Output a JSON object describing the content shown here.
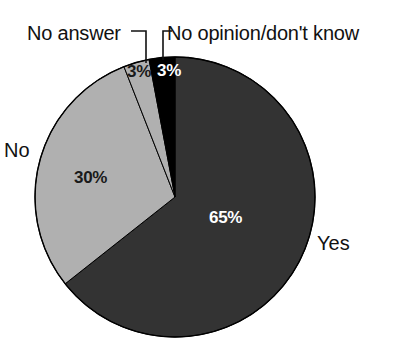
{
  "chart_data": {
    "type": "pie",
    "title": "",
    "subtitle": "",
    "xlabel": "",
    "ylabel": "",
    "legend_position": "none",
    "grid": false,
    "start_angle_deg": 0,
    "direction": "clockwise",
    "categories": [
      "Yes",
      "No",
      "No answer",
      "No opinion/don't know"
    ],
    "values": [
      65,
      30,
      3,
      3
    ],
    "value_labels": [
      "65%",
      "30%",
      "3%",
      "3%"
    ],
    "colors": [
      "#333333",
      "#b0b0b0",
      "#b0b0b0",
      "#000000"
    ],
    "slices": [
      {
        "label": "Yes",
        "value": 65,
        "value_label": "65%",
        "color": "#333333",
        "value_label_color": "#ffffff",
        "callout": false
      },
      {
        "label": "No",
        "value": 30,
        "value_label": "30%",
        "color": "#b0b0b0",
        "value_label_color": "#1a1a1a",
        "callout": false
      },
      {
        "label": "No answer",
        "value": 3,
        "value_label": "3%",
        "color": "#b0b0b0",
        "value_label_color": "#1a1a1a",
        "callout": true
      },
      {
        "label": "No opinion/don't know",
        "value": 3,
        "value_label": "3%",
        "color": "#000000",
        "value_label_color": "#ffffff",
        "callout": true
      }
    ]
  },
  "labels": {
    "no_answer": "No answer",
    "no_opinion": "No opinion/don't know",
    "no": "No",
    "yes": "Yes"
  },
  "values": {
    "yes": "65%",
    "no": "30%",
    "no_answer": "3%",
    "no_opinion": "3%"
  },
  "style": {
    "background": "#ffffff",
    "text_color": "#111111",
    "slice_yes": "#333333",
    "slice_no": "#b0b0b0",
    "slice_no_answer": "#b0b0b0",
    "slice_no_opinion": "#000000",
    "outline": "#000000"
  }
}
